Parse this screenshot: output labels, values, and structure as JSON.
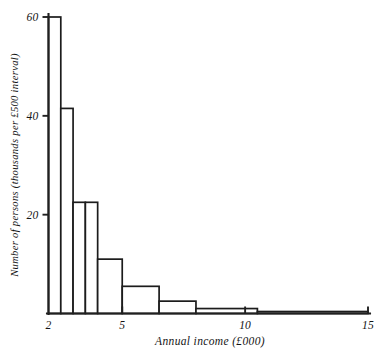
{
  "chart_data": {
    "type": "bar",
    "title": "",
    "subtitle": "",
    "xlabel": "Annual income (£000)",
    "ylabel": "Number of persons (thousands per £500 interval)",
    "xlim": [
      2,
      15
    ],
    "ylim": [
      0,
      62
    ],
    "grid": false,
    "legend": null,
    "x_tick_labels": [
      "2",
      "5",
      "10",
      "15"
    ],
    "x_tick_values": [
      2,
      5,
      10,
      15
    ],
    "y_tick_labels": [
      "20",
      "40",
      "60"
    ],
    "y_tick_values": [
      20,
      40,
      60
    ],
    "bin_unit": "£000",
    "categories": [
      "2.0–2.5",
      "2.5–3.0",
      "3.0–3.5",
      "3.5–4.0",
      "4.0–5.0",
      "5.0–6.5",
      "6.5–8.0",
      "8.0–10.5",
      "10.5–15.0"
    ],
    "bins": [
      {
        "x0": 2.0,
        "x1": 2.5,
        "value": 60.0
      },
      {
        "x0": 2.5,
        "x1": 3.0,
        "value": 41.5
      },
      {
        "x0": 3.0,
        "x1": 3.5,
        "value": 22.5
      },
      {
        "x0": 3.5,
        "x1": 4.0,
        "value": 22.5
      },
      {
        "x0": 4.0,
        "x1": 5.0,
        "value": 11.0
      },
      {
        "x0": 5.0,
        "x1": 6.5,
        "value": 5.5
      },
      {
        "x0": 6.5,
        "x1": 8.0,
        "value": 2.5
      },
      {
        "x0": 8.0,
        "x1": 10.5,
        "value": 1.0
      },
      {
        "x0": 10.5,
        "x1": 15.0,
        "value": 0.4
      }
    ],
    "values": [
      60.0,
      41.5,
      22.5,
      22.5,
      11.0,
      5.5,
      2.5,
      1.0,
      0.4
    ]
  },
  "figure": {
    "caption": "",
    "style": "hand-drawn line histogram, black on white"
  },
  "colors": {
    "ink": "#1c1c1c",
    "background": "#ffffff",
    "bar_fill": "#ffffff"
  }
}
